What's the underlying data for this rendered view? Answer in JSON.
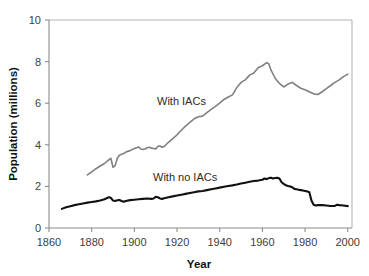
{
  "chart_data": {
    "type": "line",
    "title": "",
    "xlabel": "Year",
    "ylabel": "Population (millions)",
    "xlim": [
      1860,
      2002
    ],
    "ylim": [
      0,
      10
    ],
    "xticks": [
      1860,
      1880,
      1900,
      1920,
      1940,
      1960,
      1980,
      2000
    ],
    "yticks": [
      0,
      2,
      4,
      6,
      8,
      10
    ],
    "grid": false,
    "legend_position": "inline-annotation",
    "colors": {
      "with_iacs": "#808080",
      "with_no_iacs": "#111111",
      "axis": "#8c8c8c",
      "frame": "#b5b5b5",
      "text": "#404040",
      "background": "#ffffff"
    },
    "annotations": [
      {
        "text": "With IACs",
        "x": 1912,
        "y": 5.25
      },
      {
        "text": "With no IACs",
        "x": 1925,
        "y": 2.95
      }
    ],
    "series": [
      {
        "name": "With IACs",
        "color": "#808080",
        "stroke_width": 1.6,
        "x": [
          1878,
          1880,
          1882,
          1884,
          1886,
          1888,
          1889,
          1890,
          1891,
          1892,
          1893,
          1894,
          1895,
          1896,
          1898,
          1900,
          1902,
          1903,
          1904,
          1905,
          1906,
          1907,
          1908,
          1909,
          1910,
          1911,
          1912,
          1913,
          1914,
          1916,
          1918,
          1920,
          1922,
          1924,
          1926,
          1928,
          1930,
          1932,
          1934,
          1936,
          1938,
          1940,
          1942,
          1944,
          1946,
          1948,
          1950,
          1952,
          1954,
          1956,
          1958,
          1960,
          1962,
          1963,
          1964,
          1966,
          1968,
          1970,
          1972,
          1974,
          1976,
          1978,
          1980,
          1982,
          1984,
          1986,
          1988,
          1990,
          1992,
          1994,
          1996,
          1998,
          2000
        ],
        "y": [
          2.55,
          2.7,
          2.85,
          2.98,
          3.1,
          3.28,
          3.35,
          2.92,
          3.0,
          3.35,
          3.5,
          3.55,
          3.58,
          3.65,
          3.72,
          3.82,
          3.9,
          3.8,
          3.78,
          3.8,
          3.86,
          3.88,
          3.84,
          3.82,
          3.8,
          3.92,
          3.95,
          3.88,
          3.92,
          4.12,
          4.3,
          4.48,
          4.7,
          4.9,
          5.08,
          5.25,
          5.35,
          5.38,
          5.55,
          5.7,
          5.85,
          6.0,
          6.18,
          6.3,
          6.4,
          6.75,
          7.0,
          7.12,
          7.35,
          7.45,
          7.7,
          7.8,
          7.95,
          7.9,
          7.6,
          7.2,
          6.95,
          6.78,
          6.92,
          7.0,
          6.85,
          6.72,
          6.65,
          6.55,
          6.45,
          6.42,
          6.55,
          6.7,
          6.85,
          7.0,
          7.12,
          7.28,
          7.4
        ]
      },
      {
        "name": "With no IACs",
        "color": "#111111",
        "stroke_width": 2.1,
        "x": [
          1866,
          1868,
          1870,
          1872,
          1874,
          1876,
          1878,
          1880,
          1882,
          1884,
          1886,
          1888,
          1889,
          1890,
          1891,
          1892,
          1893,
          1894,
          1895,
          1896,
          1898,
          1900,
          1902,
          1904,
          1906,
          1908,
          1909,
          1910,
          1911,
          1912,
          1913,
          1914,
          1916,
          1918,
          1920,
          1922,
          1924,
          1926,
          1928,
          1930,
          1932,
          1934,
          1936,
          1938,
          1940,
          1942,
          1944,
          1946,
          1948,
          1950,
          1952,
          1954,
          1956,
          1958,
          1960,
          1961,
          1962,
          1963,
          1964,
          1965,
          1966,
          1967,
          1968,
          1969,
          1970,
          1971,
          1972,
          1973,
          1974,
          1975,
          1976,
          1977,
          1978,
          1979,
          1980,
          1981,
          1982,
          1983,
          1984,
          1985,
          1986,
          1988,
          1990,
          1992,
          1994,
          1995,
          1996,
          1998,
          2000
        ],
        "y": [
          0.92,
          1.0,
          1.05,
          1.1,
          1.14,
          1.18,
          1.22,
          1.25,
          1.28,
          1.32,
          1.38,
          1.48,
          1.45,
          1.32,
          1.3,
          1.33,
          1.35,
          1.3,
          1.26,
          1.3,
          1.34,
          1.36,
          1.38,
          1.4,
          1.42,
          1.4,
          1.42,
          1.5,
          1.48,
          1.42,
          1.4,
          1.43,
          1.48,
          1.52,
          1.56,
          1.6,
          1.64,
          1.68,
          1.72,
          1.76,
          1.78,
          1.82,
          1.86,
          1.9,
          1.94,
          1.98,
          2.02,
          2.05,
          2.09,
          2.14,
          2.18,
          2.22,
          2.26,
          2.28,
          2.32,
          2.38,
          2.35,
          2.4,
          2.42,
          2.38,
          2.4,
          2.41,
          2.38,
          2.2,
          2.12,
          2.05,
          2.02,
          2.0,
          1.96,
          1.88,
          1.86,
          1.84,
          1.82,
          1.8,
          1.78,
          1.76,
          1.72,
          1.32,
          1.12,
          1.08,
          1.1,
          1.1,
          1.08,
          1.06,
          1.06,
          1.12,
          1.1,
          1.08,
          1.05
        ]
      }
    ]
  },
  "axis": {
    "x_title": "Year",
    "y_title": "Population (millions)",
    "xtick_labels": [
      "1860",
      "1880",
      "1900",
      "1920",
      "1940",
      "1960",
      "1980",
      "2000"
    ],
    "ytick_labels": [
      "0",
      "2",
      "4",
      "6",
      "8",
      "10"
    ]
  },
  "labels": {
    "with_iacs": "With IACs",
    "with_no_iacs": "With no IACs"
  }
}
